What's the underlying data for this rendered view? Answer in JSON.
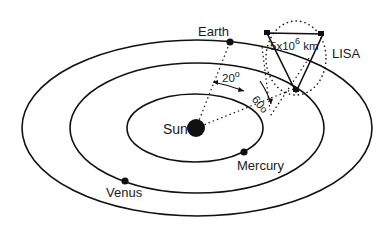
{
  "diagram": {
    "labels": {
      "sun": "Sun",
      "earth": "Earth",
      "mercury": "Mercury",
      "venus": "Venus",
      "lisa": "LISA",
      "arm_length": "5x10",
      "arm_length_exp": "6",
      "arm_length_unit": " km",
      "angle_trailing": "20",
      "angle_trailing_deg": "o",
      "angle_tilt": "60",
      "angle_tilt_deg": "o"
    },
    "colors": {
      "line": "#111111",
      "background": "#ffffff"
    }
  }
}
